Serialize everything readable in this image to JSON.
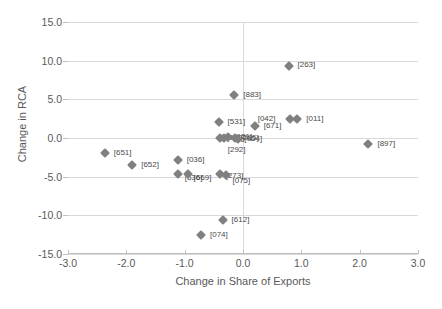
{
  "chart_data": {
    "type": "scatter",
    "title": "",
    "xlabel": "Change in Share of Exports",
    "ylabel": "Change in RCA",
    "xlim": [
      -3.0,
      3.0
    ],
    "ylim": [
      -15.0,
      15.0
    ],
    "xticks": [
      "-3.0",
      "-2.0",
      "-1.0",
      "0.0",
      "1.0",
      "2.0",
      "3.0"
    ],
    "yticks": [
      "15.0",
      "10.0",
      "5.0",
      "0.0",
      "-5.0",
      "-10.0",
      "-15.0"
    ],
    "grid": "horizontal",
    "legend": "none",
    "marker_color": "#808080",
    "marker_shape": "diamond",
    "points": [
      {
        "label": "[263]",
        "x": 0.78,
        "y": 9.3,
        "lx": 9,
        "ly": -1
      },
      {
        "label": "[883]",
        "x": -0.15,
        "y": 5.5,
        "lx": 9,
        "ly": 0
      },
      {
        "label": "[011]",
        "x": 0.93,
        "y": 2.5,
        "lx": 9,
        "ly": 0
      },
      {
        "label": "[042]",
        "x": 0.8,
        "y": 2.5,
        "lx": -32,
        "ly": 0
      },
      {
        "label": "[531]",
        "x": -0.42,
        "y": 2.1,
        "lx": 9,
        "ly": 0
      },
      {
        "label": "[671]",
        "x": 0.2,
        "y": 1.5,
        "lx": 9,
        "ly": 0
      },
      {
        "label": "[292]",
        "x": -0.33,
        "y": 0.0,
        "lx": 4,
        "ly": 12
      },
      {
        "label": "[010]",
        "x": -0.4,
        "y": 0.0,
        "lx": 7,
        "ly": 0
      },
      {
        "label": "[121]",
        "x": -0.25,
        "y": 0.1,
        "lx": 6,
        "ly": 0
      },
      {
        "label": "[285]",
        "x": -0.14,
        "y": 0.0,
        "lx": 6,
        "ly": 0
      },
      {
        "label": "[054]",
        "x": -0.08,
        "y": -0.1,
        "lx": 6,
        "ly": 0
      },
      {
        "label": "[897]",
        "x": 2.15,
        "y": -0.8,
        "lx": 9,
        "ly": 0
      },
      {
        "label": "[651]",
        "x": -2.37,
        "y": -1.9,
        "lx": 9,
        "ly": 0
      },
      {
        "label": "[652]",
        "x": -1.9,
        "y": -3.5,
        "lx": 9,
        "ly": 0
      },
      {
        "label": "[036]",
        "x": -1.12,
        "y": -2.9,
        "lx": 9,
        "ly": 0
      },
      {
        "label": "[636]",
        "x": -1.12,
        "y": -4.7,
        "lx": 7,
        "ly": 4
      },
      {
        "label": "[669]",
        "x": -0.95,
        "y": -4.7,
        "lx": 6,
        "ly": 4
      },
      {
        "label": "[273]",
        "x": -0.4,
        "y": -4.7,
        "lx": 6,
        "ly": 2
      },
      {
        "label": "[075]",
        "x": -0.3,
        "y": -4.8,
        "lx": 7,
        "ly": 6
      },
      {
        "label": "[612]",
        "x": -0.35,
        "y": -10.6,
        "lx": 9,
        "ly": 0
      },
      {
        "label": "[074]",
        "x": -0.72,
        "y": -12.6,
        "lx": 9,
        "ly": 0
      }
    ]
  }
}
